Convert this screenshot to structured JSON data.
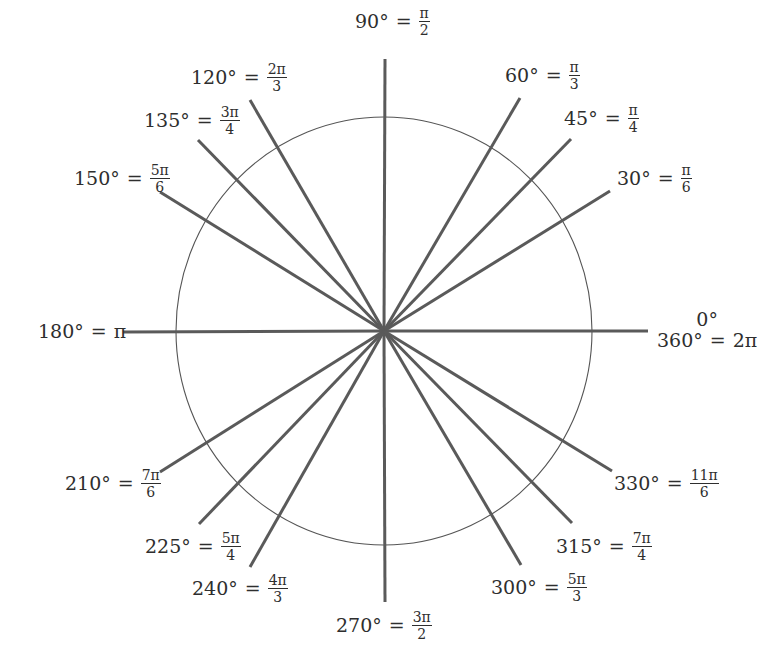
{
  "diagram": {
    "center": [
      384,
      331
    ],
    "circle": {
      "rx": 208,
      "ry": 214
    },
    "colors": {
      "spoke": "#5a5a5a",
      "circle": "#555555",
      "text": "#2e2e2e"
    },
    "spokes": [
      {
        "angle": 0,
        "end": [
          648,
          331
        ]
      },
      {
        "angle": 30,
        "end": [
          610,
          191
        ]
      },
      {
        "angle": 45,
        "end": [
          571,
          139
        ]
      },
      {
        "angle": 60,
        "end": [
          520,
          98
        ]
      },
      {
        "angle": 90,
        "end": [
          385,
          59
        ]
      },
      {
        "angle": 120,
        "end": [
          250,
          100
        ]
      },
      {
        "angle": 135,
        "end": [
          198,
          140
        ]
      },
      {
        "angle": 150,
        "end": [
          160,
          192
        ]
      },
      {
        "angle": 180,
        "end": [
          123,
          332
        ]
      },
      {
        "angle": 210,
        "end": [
          160,
          472
        ]
      },
      {
        "angle": 225,
        "end": [
          199,
          524
        ]
      },
      {
        "angle": 240,
        "end": [
          250,
          567
        ]
      },
      {
        "angle": 270,
        "end": [
          385,
          602
        ]
      },
      {
        "angle": 300,
        "end": [
          521,
          565
        ]
      },
      {
        "angle": 315,
        "end": [
          572,
          523
        ]
      },
      {
        "angle": 330,
        "end": [
          612,
          471
        ]
      }
    ],
    "labels": {
      "a0": {
        "top": "0°",
        "deg": "360°",
        "eq": "=",
        "rad": "2π"
      },
      "a30": {
        "deg": "30°",
        "eq": "=",
        "num": "π",
        "den": "6"
      },
      "a45": {
        "deg": "45°",
        "eq": "=",
        "num": "π",
        "den": "4"
      },
      "a60": {
        "deg": "60°",
        "eq": "=",
        "num": "π",
        "den": "3"
      },
      "a90": {
        "deg": "90°",
        "eq": "=",
        "num": "π",
        "den": "2"
      },
      "a120": {
        "deg": "120°",
        "eq": "=",
        "num": "2π",
        "den": "3"
      },
      "a135": {
        "deg": "135°",
        "eq": "=",
        "num": "3π",
        "den": "4"
      },
      "a150": {
        "deg": "150°",
        "eq": "=",
        "num": "5π",
        "den": "6"
      },
      "a180": {
        "deg": "180°",
        "eq": "=",
        "rad": "π"
      },
      "a210": {
        "deg": "210°",
        "eq": "=",
        "num": "7π",
        "den": "6"
      },
      "a225": {
        "deg": "225°",
        "eq": "=",
        "num": "5π",
        "den": "4"
      },
      "a240": {
        "deg": "240°",
        "eq": "=",
        "num": "4π",
        "den": "3"
      },
      "a270": {
        "deg": "270°",
        "eq": "=",
        "num": "3π",
        "den": "2"
      },
      "a300": {
        "deg": "300°",
        "eq": "=",
        "num": "5π",
        "den": "3"
      },
      "a315": {
        "deg": "315°",
        "eq": "=",
        "num": "7π",
        "den": "4"
      },
      "a330": {
        "deg": "330°",
        "eq": "=",
        "num": "11π",
        "den": "6"
      }
    }
  }
}
